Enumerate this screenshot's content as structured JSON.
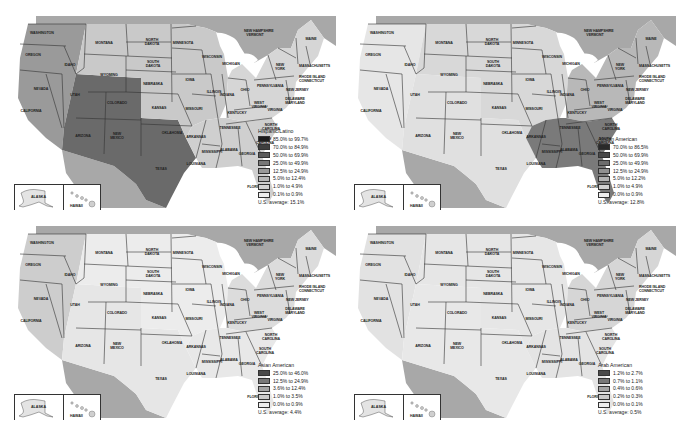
{
  "panels": [
    {
      "id": "hispanic",
      "legend": {
        "title": "Hispanic/Latino",
        "ranges": [
          {
            "label": "85.0% to 99.7%",
            "color": "#1c1c1c"
          },
          {
            "label": "70.0% to 84.9%",
            "color": "#3e3e3e"
          },
          {
            "label": "50.0% to 69.9%",
            "color": "#5a5a5a"
          },
          {
            "label": "25.0% to 49.9%",
            "color": "#777777"
          },
          {
            "label": "12.5% to 24.9%",
            "color": "#999999"
          },
          {
            "label": "5.0% to 12.4%",
            "color": "#b8b8b8"
          },
          {
            "label": "1.0% to 4.9%",
            "color": "#d4d4d4"
          },
          {
            "label": "0.1% to 0.9%",
            "color": "#eeeeee"
          }
        ],
        "average": "U.S. average:  15.1%"
      },
      "fill": {
        "west": "#9a9a9a",
        "sw": "#6a6a6a",
        "mid": "#c9c9c9",
        "east": "#d6d6d6",
        "se": "#cfcfcf"
      }
    },
    {
      "id": "african",
      "legend": {
        "title": "African American",
        "ranges": [
          {
            "label": "70.0% to 86.5%",
            "color": "#2a2a2a"
          },
          {
            "label": "50.0% to 69.9%",
            "color": "#4a4a4a"
          },
          {
            "label": "25.0% to 49.9%",
            "color": "#6c6c6c"
          },
          {
            "label": "12.5% to 24.9%",
            "color": "#909090"
          },
          {
            "label": "5.0% to 12.2%",
            "color": "#b2b2b2"
          },
          {
            "label": "1.0% to 4.9%",
            "color": "#cfcfcf"
          },
          {
            "label": "0.0% to 0.9%",
            "color": "#eeeeee"
          }
        ],
        "average": "U.S. average:  12.8%"
      },
      "fill": {
        "west": "#e6e6e6",
        "sw": "#e0e0e0",
        "mid": "#d8d8d8",
        "east": "#b8b8b8",
        "se": "#7a7a7a"
      }
    },
    {
      "id": "asian",
      "legend": {
        "title": "Asian American",
        "ranges": [
          {
            "label": "25.0% to 46.0%",
            "color": "#4a4a4a"
          },
          {
            "label": "12.5% to 24.9%",
            "color": "#787878"
          },
          {
            "label": "3.6% to 12.4%",
            "color": "#a4a4a4"
          },
          {
            "label": "1.0% to 3.5%",
            "color": "#cbcbcb"
          },
          {
            "label": "0.0% to 0.9%",
            "color": "#eeeeee"
          }
        ],
        "average": "U.S. average:  4.4%"
      },
      "fill": {
        "west": "#cdcdcd",
        "sw": "#e6e6e6",
        "mid": "#ececec",
        "east": "#dcdcdc",
        "se": "#e8e8e8"
      }
    },
    {
      "id": "arab",
      "legend": {
        "title": "Arab American",
        "ranges": [
          {
            "label": "1.2% to 2.7%",
            "color": "#4a4a4a"
          },
          {
            "label": "0.7% to 1.1%",
            "color": "#787878"
          },
          {
            "label": "0.4% to 0.6%",
            "color": "#a4a4a4"
          },
          {
            "label": "0.2% to 0.3%",
            "color": "#cbcbcb"
          },
          {
            "label": "0.0% to 0.1%",
            "color": "#eeeeee"
          }
        ],
        "average": "U.S. average:  0.5%"
      },
      "fill": {
        "west": "#e2e2e2",
        "sw": "#e8e8e8",
        "mid": "#e6e6e6",
        "east": "#d6d6d6",
        "se": "#e4e4e4"
      }
    }
  ],
  "map": {
    "canada_color": "#a8a8a8",
    "mexico_color": "#a8a8a8",
    "water_color": "#ffffff",
    "inset_labels": {
      "alaska": "ALASKA",
      "hawaii": "HAWAII"
    },
    "states": [
      {
        "name": "WASHINGTON",
        "x": 34,
        "y": 24
      },
      {
        "name": "OREGON",
        "x": 26,
        "y": 46
      },
      {
        "name": "IDAHO",
        "x": 63,
        "y": 56
      },
      {
        "name": "MONTANA",
        "x": 97,
        "y": 34
      },
      {
        "name": "WYOMING",
        "x": 102,
        "y": 66
      },
      {
        "name": "NORTH\nDAKOTA",
        "x": 145,
        "y": 31
      },
      {
        "name": "SOUTH\nDAKOTA",
        "x": 146,
        "y": 53
      },
      {
        "name": "NEVADA",
        "x": 34,
        "y": 80
      },
      {
        "name": "UTAH",
        "x": 68,
        "y": 86
      },
      {
        "name": "COLORADO",
        "x": 110,
        "y": 94
      },
      {
        "name": "NEBRASKA",
        "x": 146,
        "y": 75
      },
      {
        "name": "KANSAS",
        "x": 152,
        "y": 99
      },
      {
        "name": "CALIFORNIA",
        "x": 24,
        "y": 102
      },
      {
        "name": "ARIZONA",
        "x": 76,
        "y": 127
      },
      {
        "name": "NEW\nMEXICO",
        "x": 110,
        "y": 125
      },
      {
        "name": "OKLAHOMA",
        "x": 165,
        "y": 124
      },
      {
        "name": "TEXAS",
        "x": 154,
        "y": 160
      },
      {
        "name": "MINNESOTA",
        "x": 176,
        "y": 34
      },
      {
        "name": "IOWA",
        "x": 183,
        "y": 71
      },
      {
        "name": "MISSOURI",
        "x": 187,
        "y": 100
      },
      {
        "name": "ARKANSAS",
        "x": 189,
        "y": 128
      },
      {
        "name": "LOUISIANA",
        "x": 189,
        "y": 155
      },
      {
        "name": "WISCONSIN",
        "x": 205,
        "y": 48
      },
      {
        "name": "ILLINOIS",
        "x": 207,
        "y": 83
      },
      {
        "name": "MICHIGAN",
        "x": 224,
        "y": 55
      },
      {
        "name": "INDIANA",
        "x": 220,
        "y": 86
      },
      {
        "name": "OHIO",
        "x": 238,
        "y": 81
      },
      {
        "name": "KENTUCKY",
        "x": 230,
        "y": 104
      },
      {
        "name": "TENNESSEE",
        "x": 223,
        "y": 119
      },
      {
        "name": "MISSISSIPPI",
        "x": 205,
        "y": 143
      },
      {
        "name": "ALABAMA",
        "x": 222,
        "y": 141
      },
      {
        "name": "GEORGIA",
        "x": 240,
        "y": 145
      },
      {
        "name": "FLORIDA",
        "x": 248,
        "y": 178
      },
      {
        "name": "SOUTH\nCAROLINA",
        "x": 258,
        "y": 130
      },
      {
        "name": "NORTH\nCAROLINA",
        "x": 264,
        "y": 116
      },
      {
        "name": "VIRGINIA",
        "x": 268,
        "y": 101
      },
      {
        "name": "WEST\nVIRGINIA",
        "x": 252,
        "y": 94
      },
      {
        "name": "PENNSYLVANIA",
        "x": 261,
        "y": 77
      },
      {
        "name": "NEW\nYORK",
        "x": 273,
        "y": 56
      },
      {
        "name": "NEW JERSEY",
        "x": 290,
        "y": 81
      },
      {
        "name": "DELAWARE\nMARYLAND",
        "x": 288,
        "y": 90
      },
      {
        "name": "MASSACHUSETTS",
        "x": 303,
        "y": 57
      },
      {
        "name": "RHODE ISLAND\nCONNECTICUT",
        "x": 303,
        "y": 68
      },
      {
        "name": "NEW HAMPSHIRE\nVERMONT",
        "x": 248,
        "y": 22
      },
      {
        "name": "MAINE",
        "x": 304,
        "y": 30
      }
    ]
  }
}
